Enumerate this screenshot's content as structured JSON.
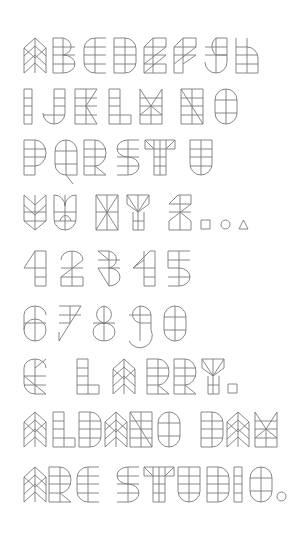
{
  "specimen": {
    "title": "Geometric display typeface specimen",
    "stroke_color": "#7a7a7a",
    "background": "#ffffff",
    "glyph_height": 35,
    "rows": [
      {
        "y": 38,
        "text": "ABCDEFGH",
        "glyphs": [
          [
            "A",
            24
          ],
          [
            "B",
            53
          ],
          [
            "C",
            84
          ],
          [
            "D",
            114
          ],
          [
            "E",
            144
          ],
          [
            "F",
            174
          ],
          [
            "G",
            205
          ],
          [
            "H",
            236
          ]
        ]
      },
      {
        "y": 89,
        "text": "IJKLMNO",
        "glyphs": [
          [
            "I",
            24
          ],
          [
            "J",
            43
          ],
          [
            "K",
            75
          ],
          [
            "L",
            109
          ],
          [
            "M",
            140
          ],
          [
            "N",
            181
          ],
          [
            "O",
            215
          ]
        ]
      },
      {
        "y": 140,
        "text": "PQRSTU",
        "glyphs": [
          [
            "P",
            24
          ],
          [
            "Q",
            55
          ],
          [
            "R",
            84
          ],
          [
            "S",
            117
          ],
          [
            "T",
            145
          ],
          [
            "U",
            190
          ]
        ]
      },
      {
        "y": 195,
        "text": "VWXYZ.○△",
        "glyphs": [
          [
            "V",
            24
          ],
          [
            "W",
            54
          ],
          [
            "X",
            96
          ],
          [
            "Y",
            127
          ],
          [
            "Z",
            169
          ],
          [
            "sq",
            201
          ],
          [
            "ci",
            221
          ],
          [
            "tr",
            239
          ]
        ]
      },
      {
        "y": 251,
        "text": "12345",
        "glyphs": [
          [
            "1",
            24
          ],
          [
            "2",
            61
          ],
          [
            "3",
            98
          ],
          [
            "4",
            133
          ],
          [
            "5",
            168
          ]
        ]
      },
      {
        "y": 306,
        "text": "67890",
        "glyphs": [
          [
            "6",
            24
          ],
          [
            "7",
            59
          ],
          [
            "8",
            93
          ],
          [
            "9",
            129
          ],
          [
            "0",
            164
          ]
        ]
      },
      {
        "y": 359,
        "text": "& LARRY.",
        "glyphs": [
          [
            "&",
            24
          ],
          [
            "L",
            77
          ],
          [
            "A",
            113
          ],
          [
            "R",
            147
          ],
          [
            "R",
            174
          ],
          [
            "Y",
            202
          ],
          [
            "sq",
            228
          ]
        ]
      },
      {
        "y": 412,
        "text": "ALDANO DAM",
        "glyphs": [
          [
            "A",
            24
          ],
          [
            "L",
            53
          ],
          [
            "D",
            79
          ],
          [
            "A",
            105
          ],
          [
            "N",
            130
          ],
          [
            "O",
            158
          ],
          [
            "D",
            201
          ],
          [
            "A",
            227
          ],
          [
            "M",
            255
          ]
        ]
      },
      {
        "y": 467,
        "text": "ARC STUDIO.",
        "glyphs": [
          [
            "A",
            24
          ],
          [
            "R",
            49
          ],
          [
            "C",
            77
          ],
          [
            "S",
            117
          ],
          [
            "T",
            144
          ],
          [
            "U",
            178
          ],
          [
            "D",
            207
          ],
          [
            "I",
            234
          ],
          [
            "O",
            250
          ],
          [
            "ci",
            277
          ]
        ]
      }
    ],
    "glyph_paths": {
      "A": "M0 35 L0 10 L11 0 L22 10 L22 35 L11 25 Z M0 10 L11 20 L22 10 M0 18 L11 8 L22 18 M0 27 L11 17 L22 27 M11 0 L11 35",
      "B": "M0 0 H10 A12 9 0 0 1 10 17 A12 9 0 0 1 10 35 H0 Z M0 9 H22 M0 17 H22 M0 26 H22 M10 0 V35",
      "C": "M22 0 H11 A11 11 0 0 0 0 11 V24 A11 11 0 0 0 11 35 H22 M0 9 H22 M0 17 H22 M0 26 H22 M11 0 V35",
      "D": "M0 0 H11 A11 11 0 0 1 22 11 V24 A11 11 0 0 1 11 35 H0 Z M0 9 H22 M0 17 H22 M0 26 H22 M11 0 V35",
      "E": "M0 35 V9 L9 0 H22 V9 L0 26 M0 9 H22 M0 17 H22 M0 26 H22 M9 0 V35 M22 17 L0 35 M0 35 H22 V26",
      "F": "M0 35 V9 L9 0 H22 V9 L0 26 M0 9 H22 M0 17 H22 M9 0 V35 M22 17 L9 26 M0 35 H9",
      "G": "M22 0 H11 A11 11 0 0 0 11 17 H22 Z M22 17 V24 A11 11 0 0 1 0 24 M0 9 H22 M0 17 H22 M11 0 V35",
      "H": "M0 0 V35 H22 V20 A11 11 0 0 0 11 9 H0 M0 17 H22 M0 26 H22 M11 0 V35",
      "I": "M0 0 H8 V35 H0 Z M0 9 H8 M0 17 H8 M0 26 H8",
      "J": "M22 0 V24 A11 11 0 0 1 0 24 M11 0 H22 M11 0 V35 M11 9 H22 M11 17 H22 M0 26 H22",
      "K": "M0 0 H22 L11 17 L22 35 H0 Z M0 9 H22 M0 17 H22 M0 26 H22 M11 0 V35",
      "L": "M0 0 H11 V26 H22 V35 H0 Z M0 9 H11 M0 17 H11 M0 26 H11 M11 26 V35",
      "M": "M0 0 L11 17 L22 0 V35 H0 Z M0 9 H22 M0 17 H22 M0 26 H22 M11 17 V35 M0 26 L11 17 L22 26",
      "N": "M0 0 H22 V35 H0 Z M0 0 L22 35 M0 9 H22 M0 17 H22 M0 26 H22 M11 0 V35",
      "O": "M11 0 A11 11 0 0 1 22 11 V24 A11 11 0 0 1 0 24 V11 A11 11 0 0 1 11 0 Z M0 11 H22 M0 24 H22 M11 0 V35",
      "P": "M0 0 H11 A11 13 0 0 1 11 26 H0 Z M0 26 V35 H11 V0 M0 9 H22 M0 17 H22",
      "Q": "M11 0 A11 11 0 0 1 22 11 V35 H11 A11 11 0 0 1 0 24 V11 A11 11 0 0 1 11 0 Z M0 11 H22 M0 24 H22 M11 0 V35 M11 35 L18 44",
      "R": "M0 0 H11 A11 13 0 0 1 11 26 L22 35 H0 Z M0 9 H22 M0 17 H22 M0 26 H11 M11 0 V35",
      "S": "M22 0 H11 A11 8.5 0 0 0 11 17 A11 9 0 0 1 11 35 H0 M0 9 H22 M0 17 H22 M0 26 H22 M11 0 V35",
      "T": "M0 0 H30 V9 H0 Z M0 0 L9 9 M30 0 L21 9 M9 0 V35 H21 V0 M9 17 H21 M9 26 H21 M15 0 V35",
      "U": "M0 0 V24 A11 11 0 0 0 22 24 V0 Z M0 9 H22 M0 17 H22 M0 26 H22 M11 0 V35",
      "V": "M0 0 L11 10 L22 0 V26 L11 35 L0 26 Z M0 10 L11 20 L22 10 M0 17 H22 M0 26 H22 M11 0 V35",
      "W": "M0 0 A11 11 0 0 1 11 11 A11 11 0 0 1 22 0 V24 A11 11 0 0 1 11 35 A11 11 0 0 1 0 24 Z M0 17 H22 M0 26 H22 M11 0 V35 M6 26 A6 9 0 0 1 17 26",
      "X": "M0 0 L22 35 M22 0 L0 35 M0 0 H22 V35 H0 Z M0 17 H22 M11 0 V35",
      "Y": "M0 0 H22 V9 L11 17 L0 9 Z M0 0 L11 17 L22 0 M6 17 V35 H17 V17 M6 26 H17 M11 0 V35",
      "Z": "M9 0 H22 V9 L0 26 V35 H22 V26 L11 17 M0 9 L9 0 M0 9 H22 M0 17 H22 M11 0 V35",
      "sq": "M0 25 H9 V34 H0 Z",
      "ci": "M4.5 25 A4.5 4.5 0 1 1 4.5 34 A4.5 4.5 0 1 1 4.5 25 Z",
      "tr": "M0 34 L4.5 25 L9 34 Z",
      "1": "M0 17 L11 0 H22 V35 H11 V0 M0 17 H22 M11 26 H22",
      "2": "M0 9 A11 9 0 0 1 22 9 L0 26 V35 H22 V26 H0 M0 17 H22 M11 0 V35",
      "3": "M0 0 H11 A11 9 0 0 1 11 17 A11 9 0 0 1 11 35 L0 17 M0 0 L11 9 M0 9 H22 M0 17 H22 M11 0 V35",
      "4": "M0 17 L17 0 H22 V35 H11 V0 M0 17 H22 M0 17 L11 9 M11 26 H22",
      "5": "M22 0 H0 V17 H11 A11 9 0 0 1 11 35 H0 M0 9 H22 M0 26 H22 M11 0 V35",
      "6": "M22 9 A11 9 0 0 0 0 9 V24 A11 11 0 0 0 22 24 A11 11 0 0 0 0 24 M0 17 H22 M11 0 V35",
      "7": "M0 0 H22 L0 35 V26 M0 9 H22 M11 0 V17 M0 17 L11 17",
      "8": "M11 0 A11 9 0 0 1 11 17 A11 9 0 0 1 11 35 A11 9 0 0 1 11 17 A11 9 0 0 1 11 0 Z M0 17 H22 M11 0 V35",
      "9": "M11 0 A11 9 0 0 1 22 9 V24 A11 11 0 0 1 0 35 M11 0 A11 9 0 0 0 11 17 H22 M0 9 H22 M11 0 V35",
      "0": "M11 0 A11 11 0 0 1 22 11 V24 A11 11 0 0 1 0 24 V11 A11 11 0 0 1 11 0 Z M0 11 H22 M0 24 H22 M11 0 V35",
      "&": "M22 9 A11 9 0 0 0 0 9 V24 A11 11 0 0 0 11 35 H22 L0 17 H22 M11 9 L22 0 M0 26 H22 M11 0 V35"
    }
  }
}
